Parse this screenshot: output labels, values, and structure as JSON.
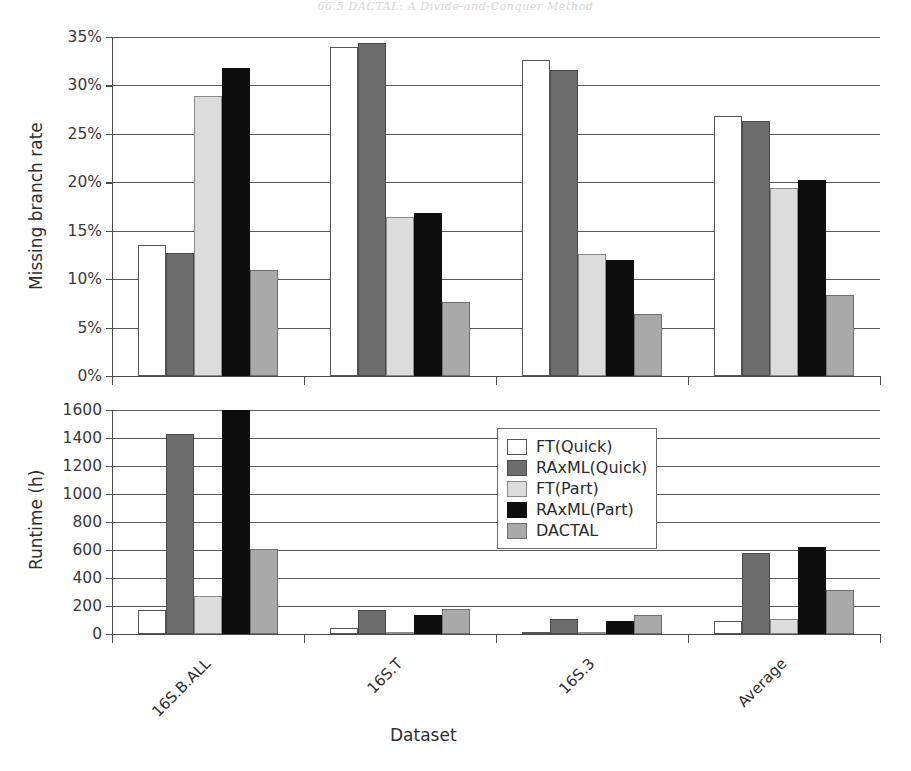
{
  "page": {
    "header_remnant": "66.5  DACTAL: A Divide-and-Conquer Method"
  },
  "chart_data": [
    {
      "type": "bar",
      "id": "missing-branch-rate",
      "title": "",
      "xlabel": "",
      "ylabel": "Missing branch rate",
      "categories": [
        "16S.B.ALL",
        "16S.T",
        "16S.3",
        "Average"
      ],
      "ylim": [
        0,
        35
      ],
      "ytick_labels": [
        "0%",
        "5%",
        "10%",
        "15%",
        "20%",
        "25%",
        "30%",
        "35%"
      ],
      "ytick_values": [
        0,
        5,
        10,
        15,
        20,
        25,
        30,
        35
      ],
      "grid": true,
      "legend": "none",
      "series": [
        {
          "name": "FT(Quick)",
          "color": "#ffffff",
          "values": [
            13.5,
            34.0,
            32.6,
            26.8
          ]
        },
        {
          "name": "RAxML(Quick)",
          "color": "#6d6d6d",
          "values": [
            12.7,
            34.4,
            31.6,
            26.3
          ]
        },
        {
          "name": "FT(Part)",
          "color": "#dcdcdc",
          "values": [
            28.9,
            16.4,
            12.6,
            19.4
          ]
        },
        {
          "name": "RAxML(Part)",
          "color": "#0d0d0d",
          "values": [
            31.8,
            16.8,
            12.0,
            20.2
          ]
        },
        {
          "name": "DACTAL",
          "color": "#a9a9a9",
          "values": [
            10.9,
            7.6,
            6.4,
            8.4
          ]
        }
      ]
    },
    {
      "type": "bar",
      "id": "runtime-hours",
      "title": "",
      "xlabel": "Dataset",
      "ylabel": "Runtime (h)",
      "categories": [
        "16S.B.ALL",
        "16S.T",
        "16S.3",
        "Average"
      ],
      "ylim": [
        0,
        1600
      ],
      "ytick_labels": [
        "0",
        "200",
        "400",
        "600",
        "800",
        "1000",
        "1200",
        "1400",
        "1600"
      ],
      "ytick_values": [
        0,
        200,
        400,
        600,
        800,
        1000,
        1200,
        1400,
        1600
      ],
      "grid": true,
      "legend": "upper-center",
      "series": [
        {
          "name": "FT(Quick)",
          "color": "#ffffff",
          "values": [
            175,
            45,
            2,
            90
          ]
        },
        {
          "name": "RAxML(Quick)",
          "color": "#6d6d6d",
          "values": [
            1430,
            175,
            110,
            580
          ]
        },
        {
          "name": "FT(Part)",
          "color": "#dcdcdc",
          "values": [
            270,
            6,
            3,
            105
          ]
        },
        {
          "name": "RAxML(Part)",
          "color": "#0d0d0d",
          "values": [
            1600,
            135,
            95,
            620
          ]
        },
        {
          "name": "DACTAL",
          "color": "#a9a9a9",
          "values": [
            610,
            180,
            135,
            315
          ]
        }
      ]
    }
  ],
  "legend": {
    "items": [
      {
        "label": "FT(Quick)",
        "swatch": "white"
      },
      {
        "label": "RAxML(Quick)",
        "swatch": "dark"
      },
      {
        "label": "FT(Part)",
        "swatch": "light"
      },
      {
        "label": "RAxML(Part)",
        "swatch": "black"
      },
      {
        "label": "DACTAL",
        "swatch": "medium"
      }
    ]
  }
}
